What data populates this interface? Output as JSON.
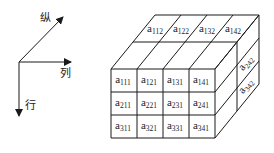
{
  "axes": {
    "origin": [
      19,
      62
    ],
    "items": [
      {
        "name": "vertical-depth",
        "label": "纵",
        "tip": [
          63,
          17
        ],
        "label_pos": [
          40,
          22
        ]
      },
      {
        "name": "column",
        "label": "列",
        "tip": [
          71,
          62
        ],
        "label_pos": [
          60,
          77
        ]
      },
      {
        "name": "row",
        "label": "行",
        "tip": [
          19,
          116
        ],
        "label_pos": [
          25,
          109
        ]
      }
    ]
  },
  "cube": {
    "front": {
      "x": 111,
      "y": 69,
      "cell_w": 26,
      "cell_h": 23,
      "rows": 3,
      "cols": 4
    },
    "depth_step": [
      22,
      -27
    ],
    "layers": 2,
    "front_cells": [
      [
        "a|111",
        "a|121",
        "a|131",
        "a|141"
      ],
      [
        "a|211",
        "a|221",
        "a|231",
        "a|241"
      ],
      [
        "a|311",
        "a|321",
        "a|331",
        "a|341"
      ]
    ],
    "top_back_cells": [
      "a|112",
      "a|122",
      "a|132",
      "a|142"
    ],
    "side_back_cells": [
      "a|242",
      "a|342"
    ]
  }
}
